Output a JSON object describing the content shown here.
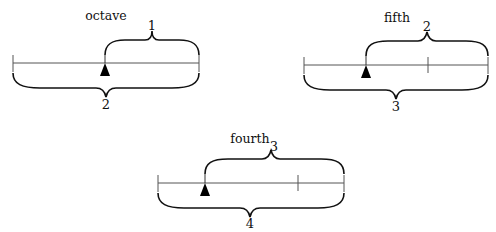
{
  "top_caption_fragment": "…g p… (…) …",
  "panels": [
    {
      "id": "octave",
      "title": "octave",
      "upper_brace_label": "1",
      "lower_brace_label": "2",
      "line": {
        "x1": 13,
        "x2": 199,
        "y": 63
      },
      "divisions": [],
      "arrow_x": 105
    },
    {
      "id": "fifth",
      "title": "fifth",
      "upper_brace_label": "2",
      "lower_brace_label": "3",
      "line": {
        "x1": 304,
        "x2": 488,
        "y": 65
      },
      "divisions": [
        428
      ],
      "arrow_x": 366
    },
    {
      "id": "fourth",
      "title": "fourth",
      "upper_brace_label": "3",
      "lower_brace_label": "4",
      "line": {
        "x1": 158,
        "x2": 344,
        "y": 183
      },
      "divisions": [
        298
      ],
      "arrow_x": 205
    }
  ],
  "colors": {
    "line": "#555555",
    "brace": "#111111",
    "arrow": "#000000"
  }
}
